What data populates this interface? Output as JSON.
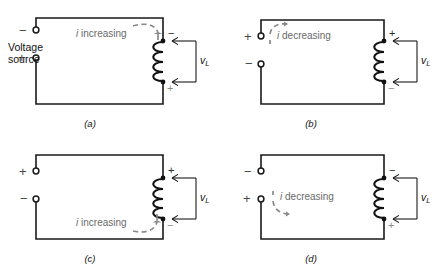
{
  "figure": {
    "type": "circuit-diagram-set",
    "panel_count": 4,
    "colors": {
      "wire": "#1a1a1a",
      "coil": "#111111",
      "current_arrow": "#8a8a8a",
      "current_text": "#6a6a6a",
      "sign_light": "#4a4a4a",
      "background": "#ffffff"
    }
  },
  "panels": [
    {
      "id": "a",
      "caption": "(a)",
      "source_label_line1": "Voltage",
      "source_label_line2": "source",
      "terminal_top_sign": "−",
      "terminal_bottom_sign": "+",
      "current_text_italic": "i",
      "current_text_rest": " increasing",
      "current_direction": "down-into-coil",
      "coil_top_sign": "−",
      "coil_bottom_sign": "+",
      "voltage_label": "v",
      "voltage_sub": "L",
      "coil_turns": 4
    },
    {
      "id": "b",
      "caption": "(b)",
      "source_label_line1": "",
      "source_label_line2": "",
      "terminal_top_sign": "+",
      "terminal_bottom_sign": "−",
      "current_text_italic": "i",
      "current_text_rest": " decreasing",
      "current_direction": "right-along-top",
      "coil_top_sign": "+",
      "coil_bottom_sign": "−",
      "voltage_label": "v",
      "voltage_sub": "L",
      "coil_turns": 4
    },
    {
      "id": "c",
      "caption": "(c)",
      "source_label_line1": "",
      "source_label_line2": "",
      "terminal_top_sign": "+",
      "terminal_bottom_sign": "−",
      "current_text_italic": "i",
      "current_text_rest": " increasing",
      "current_direction": "up-into-coil",
      "coil_top_sign": "+",
      "coil_bottom_sign": "−",
      "voltage_label": "v",
      "voltage_sub": "L",
      "coil_turns": 4
    },
    {
      "id": "d",
      "caption": "(d)",
      "source_label_line1": "",
      "source_label_line2": "",
      "terminal_top_sign": "−",
      "terminal_bottom_sign": "+",
      "current_text_italic": "i",
      "current_text_rest": " decreasing",
      "current_direction": "right-along-bottom",
      "coil_top_sign": "−",
      "coil_bottom_sign": "+",
      "voltage_label": "v",
      "voltage_sub": "L",
      "coil_turns": 4
    }
  ]
}
